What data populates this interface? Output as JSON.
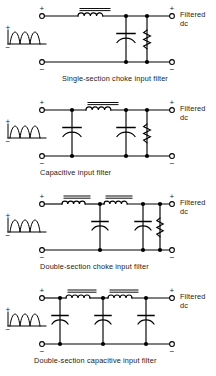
{
  "figure": {
    "line_color": "#000000",
    "background": "#ffffff",
    "text_color": "#1b1b1b"
  },
  "common": {
    "input_waveform_name": "full-wave-rectified-sine",
    "input_plus": "+",
    "input_minus": "−",
    "output_plus": "+",
    "output_minus": "−",
    "output_label_line1": "Filtered",
    "output_label_line2": "dc"
  },
  "circuits": [
    {
      "id": "single-section-choke-input-filter",
      "caption": "Single-section choke input filter",
      "caption_left_px": 62,
      "top_px": 0,
      "components": [
        {
          "type": "choke",
          "name": "series-choke-1"
        },
        {
          "type": "capacitor",
          "name": "shunt-capacitor-1"
        },
        {
          "type": "resistor",
          "name": "load-resistor"
        }
      ]
    },
    {
      "id": "capacitive-input-filter",
      "caption": "Capacitive input filter",
      "caption_left_px": 40,
      "top_px": 94,
      "components": [
        {
          "type": "capacitor",
          "name": "input-capacitor"
        },
        {
          "type": "choke",
          "name": "series-choke-1"
        },
        {
          "type": "capacitor",
          "name": "shunt-capacitor-1"
        },
        {
          "type": "resistor",
          "name": "load-resistor"
        }
      ]
    },
    {
      "id": "double-section-choke-input-filter",
      "caption": "Double-section choke input filter",
      "caption_left_px": 40,
      "top_px": 188,
      "components": [
        {
          "type": "choke",
          "name": "series-choke-1"
        },
        {
          "type": "capacitor",
          "name": "shunt-capacitor-1"
        },
        {
          "type": "choke",
          "name": "series-choke-2"
        },
        {
          "type": "capacitor",
          "name": "shunt-capacitor-2"
        },
        {
          "type": "resistor",
          "name": "load-resistor"
        }
      ]
    },
    {
      "id": "double-section-capacitive-input-filter",
      "caption": "Double-section capacitive input filter",
      "caption_left_px": 34,
      "top_px": 282,
      "components": [
        {
          "type": "capacitor",
          "name": "input-capacitor"
        },
        {
          "type": "choke",
          "name": "series-choke-1"
        },
        {
          "type": "capacitor",
          "name": "shunt-capacitor-1"
        },
        {
          "type": "choke",
          "name": "series-choke-2"
        },
        {
          "type": "capacitor",
          "name": "shunt-capacitor-2"
        }
      ]
    }
  ]
}
